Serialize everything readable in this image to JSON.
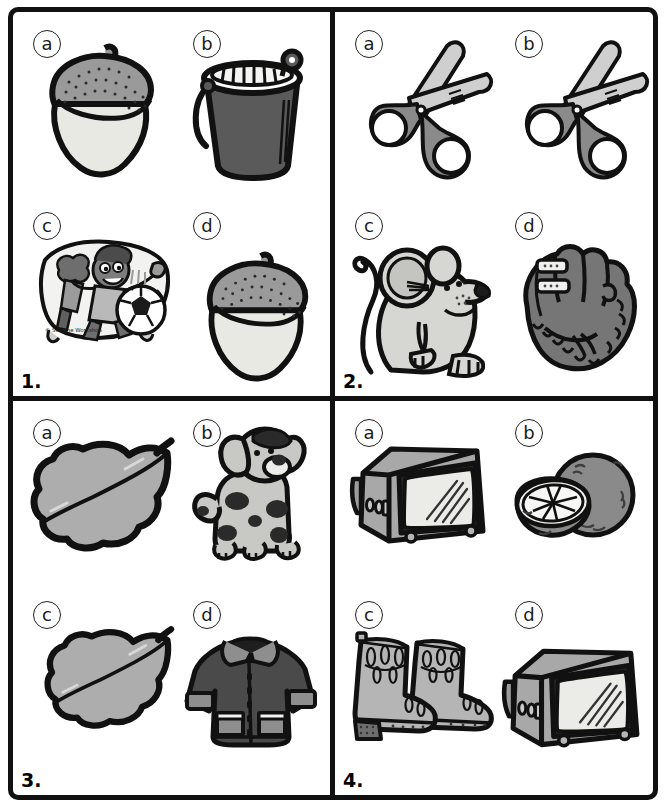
{
  "worksheet": {
    "title": "Picture matching worksheet",
    "layout": "2x2 grid of numbered questions, each with four labelled picture options",
    "option_labels": [
      "a",
      "b",
      "c",
      "d"
    ]
  },
  "questions": [
    {
      "number": "1.",
      "options": [
        {
          "label": "a",
          "picture": "acorn",
          "picture_alt": "acorn-icon"
        },
        {
          "label": "b",
          "picture": "bucket",
          "picture_alt": "bucket-icon"
        },
        {
          "label": "c",
          "picture": "sesame-street-sticker",
          "picture_alt": "children-playing-soccer-sticker-icon",
          "caption": "© Sesame Workshop"
        },
        {
          "label": "d",
          "picture": "acorn",
          "picture_alt": "acorn-icon"
        }
      ]
    },
    {
      "number": "2.",
      "options": [
        {
          "label": "a",
          "picture": "scissors",
          "picture_alt": "scissors-icon"
        },
        {
          "label": "b",
          "picture": "scissors",
          "picture_alt": "scissors-icon"
        },
        {
          "label": "c",
          "picture": "mouse",
          "picture_alt": "mouse-icon"
        },
        {
          "label": "d",
          "picture": "baseball-glove",
          "picture_alt": "baseball-glove-icon"
        }
      ]
    },
    {
      "number": "3.",
      "options": [
        {
          "label": "a",
          "picture": "leaf",
          "picture_alt": "leaf-icon"
        },
        {
          "label": "b",
          "picture": "dog",
          "picture_alt": "dalmatian-dog-icon"
        },
        {
          "label": "c",
          "picture": "leaf",
          "picture_alt": "leaf-icon"
        },
        {
          "label": "d",
          "picture": "coat",
          "picture_alt": "winter-coat-icon"
        }
      ]
    },
    {
      "number": "4.",
      "options": [
        {
          "label": "a",
          "picture": "television",
          "picture_alt": "television-icon"
        },
        {
          "label": "b",
          "picture": "orange",
          "picture_alt": "orange-fruit-icon"
        },
        {
          "label": "c",
          "picture": "boots",
          "picture_alt": "boots-icon"
        },
        {
          "label": "d",
          "picture": "television",
          "picture_alt": "television-icon"
        }
      ]
    }
  ],
  "colors": {
    "ink": "#111111",
    "paper": "#ffffff",
    "light_gray": "#d6d6d2",
    "cream": "#e9e9e3",
    "mid_gray": "#9a9a9a",
    "gray": "#8a8a8a",
    "dark_gray": "#5a5a5a",
    "darker_gray": "#4a4a4a",
    "glove_gray": "#767676",
    "screen": "#ebebe8"
  }
}
